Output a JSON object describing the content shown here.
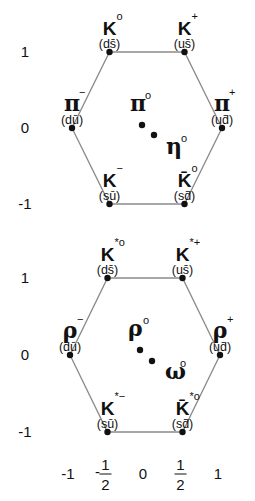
{
  "y_axis": {
    "ticks": [
      "1",
      "0",
      "-1"
    ],
    "values": [
      1,
      0,
      -1
    ]
  },
  "x_axis": {
    "ticks": [
      {
        "value": -1,
        "label": "-1"
      },
      {
        "value": -0.5,
        "label": "-",
        "num": "1",
        "den": "2"
      },
      {
        "value": 0,
        "label": "0"
      },
      {
        "value": 0.5,
        "label": "",
        "num": "1",
        "den": "2"
      },
      {
        "value": 1,
        "label": "1"
      }
    ]
  },
  "colors": {
    "edge": "#8a8a8a",
    "dot": "#111111",
    "text": "#111111"
  },
  "diagrams": [
    {
      "name": "pseudoscalar",
      "vertices": [
        {
          "symbol": "K",
          "sup": "o",
          "quarks": "(ds̄)",
          "x": -0.5,
          "y": 1
        },
        {
          "symbol": "K",
          "sup": "+",
          "quarks": "(us̄)",
          "x": 0.5,
          "y": 1
        },
        {
          "symbol": "π",
          "sup": "−",
          "quarks": "(dū)",
          "x": -1,
          "y": 0
        },
        {
          "symbol": "π",
          "sup": "+",
          "quarks": "(ud̄)",
          "x": 1,
          "y": 0
        },
        {
          "symbol": "K",
          "sup": "−",
          "quarks": "(sū)",
          "x": -0.5,
          "y": -1
        },
        {
          "symbol": "K̄",
          "sup": "o",
          "quarks": "(sd̄)",
          "x": 0.5,
          "y": -1
        }
      ],
      "center": [
        {
          "symbol": "π",
          "sup": "o"
        },
        {
          "symbol": "η",
          "sup": "o"
        }
      ]
    },
    {
      "name": "vector",
      "vertices": [
        {
          "symbol": "K",
          "sup": "*o",
          "quarks": "(ds̄)",
          "x": -0.5,
          "y": 1
        },
        {
          "symbol": "K",
          "sup": "*+",
          "quarks": "(us̄)",
          "x": 0.5,
          "y": 1
        },
        {
          "symbol": "ρ",
          "sup": "−",
          "quarks": "(dū)",
          "x": -1,
          "y": 0
        },
        {
          "symbol": "ρ",
          "sup": "+",
          "quarks": "(ud̄)",
          "x": 1,
          "y": 0
        },
        {
          "symbol": "K",
          "sup": "*−",
          "quarks": "(sū)",
          "x": -0.5,
          "y": -1
        },
        {
          "symbol": "K̄",
          "sup": "*o",
          "quarks": "(sd̄)",
          "x": 0.5,
          "y": -1
        }
      ],
      "center": [
        {
          "symbol": "ρ",
          "sup": "o"
        },
        {
          "symbol": "ω",
          "sup": "o"
        }
      ]
    }
  ]
}
